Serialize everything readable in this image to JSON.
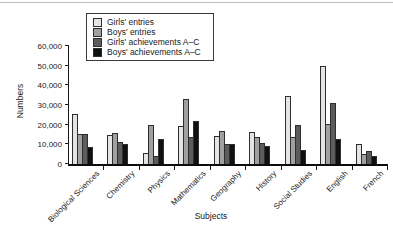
{
  "chart_data": {
    "type": "bar",
    "title": "",
    "xlabel": "Subjects",
    "ylabel": "Numbers",
    "ylim": [
      0,
      60000
    ],
    "ytick_step": 10000,
    "ytick_labels": [
      "0",
      "10,000",
      "20,000",
      "30,000",
      "40,000",
      "50,000",
      "60,000"
    ],
    "grid": false,
    "legend_position": "top-left",
    "bar_outline_color": "#2e2e2e",
    "axis_color": "#1a1a1a",
    "categories": [
      "Biological Sciences",
      "Chemistry",
      "Physics",
      "Mathematics",
      "Geography",
      "History",
      "Social Studies",
      "English",
      "French"
    ],
    "series": [
      {
        "name": "Girls' entries",
        "color": "#e4e4e4",
        "values": [
          25500,
          15000,
          5500,
          19500,
          14000,
          16500,
          34500,
          50000,
          10000
        ]
      },
      {
        "name": "Boys' entries",
        "color": "#a0a0a0",
        "values": [
          15500,
          16000,
          20000,
          33000,
          17000,
          13500,
          13500,
          20500,
          5000
        ]
      },
      {
        "name": "Girls' achievements A–C",
        "color": "#5c5c5c",
        "values": [
          15500,
          11000,
          4000,
          13500,
          10000,
          10500,
          20000,
          31000,
          6500
        ]
      },
      {
        "name": "Boys' achievements A–C",
        "color": "#101010",
        "values": [
          8500,
          10000,
          12500,
          22000,
          10000,
          9000,
          7000,
          12500,
          4000
        ]
      }
    ]
  }
}
